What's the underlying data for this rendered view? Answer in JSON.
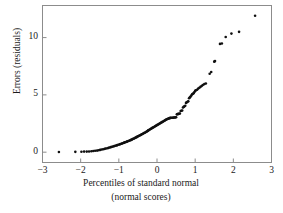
{
  "chart_data": {
    "type": "scatter",
    "title": "",
    "xlabel": "Percentiles of standard normal",
    "xlabel_line2": "(normal scores)",
    "ylabel": "Errors (residuals)",
    "xlim": [
      -3,
      3
    ],
    "ylim": [
      -0.9,
      12.8
    ],
    "xticks": [
      -3,
      -2,
      -1,
      0,
      1,
      2,
      3
    ],
    "xticklabels": [
      "−3",
      "−2",
      "−1",
      "0",
      "1",
      "2",
      "3"
    ],
    "yticks": [
      0,
      5,
      10
    ],
    "yticklabels": [
      "0",
      "5",
      "10"
    ],
    "grid": false,
    "legend": null,
    "marker": "filled-circle",
    "marker_color": "#101010",
    "marker_size_px": 2.6,
    "frame": true,
    "tick_direction": "in",
    "points": [
      [
        -2.57,
        0.02
      ],
      [
        -2.14,
        0.03
      ],
      [
        -1.98,
        0.04
      ],
      [
        -1.91,
        0.05
      ],
      [
        -1.84,
        0.05
      ],
      [
        -1.78,
        0.06
      ],
      [
        -1.72,
        0.08
      ],
      [
        -1.67,
        0.1
      ],
      [
        -1.62,
        0.12
      ],
      [
        -1.57,
        0.14
      ],
      [
        -1.53,
        0.17
      ],
      [
        -1.49,
        0.2
      ],
      [
        -1.45,
        0.23
      ],
      [
        -1.41,
        0.26
      ],
      [
        -1.37,
        0.29
      ],
      [
        -1.34,
        0.32
      ],
      [
        -1.3,
        0.35
      ],
      [
        -1.27,
        0.38
      ],
      [
        -1.24,
        0.41
      ],
      [
        -1.21,
        0.44
      ],
      [
        -1.18,
        0.47
      ],
      [
        -1.15,
        0.5
      ],
      [
        -1.12,
        0.53
      ],
      [
        -1.09,
        0.56
      ],
      [
        -1.06,
        0.59
      ],
      [
        -1.04,
        0.62
      ],
      [
        -1.01,
        0.65
      ],
      [
        -0.98,
        0.68
      ],
      [
        -0.96,
        0.71
      ],
      [
        -0.93,
        0.74
      ],
      [
        -0.91,
        0.77
      ],
      [
        -0.88,
        0.8
      ],
      [
        -0.86,
        0.83
      ],
      [
        -0.84,
        0.86
      ],
      [
        -0.81,
        0.89
      ],
      [
        -0.79,
        0.92
      ],
      [
        -0.77,
        0.95
      ],
      [
        -0.75,
        0.98
      ],
      [
        -0.72,
        1.01
      ],
      [
        -0.7,
        1.04
      ],
      [
        -0.68,
        1.07
      ],
      [
        -0.66,
        1.1
      ],
      [
        -0.64,
        1.14
      ],
      [
        -0.62,
        1.17
      ],
      [
        -0.6,
        1.2
      ],
      [
        -0.58,
        1.24
      ],
      [
        -0.56,
        1.27
      ],
      [
        -0.54,
        1.31
      ],
      [
        -0.52,
        1.34
      ],
      [
        -0.5,
        1.38
      ],
      [
        -0.48,
        1.41
      ],
      [
        -0.46,
        1.45
      ],
      [
        -0.44,
        1.48
      ],
      [
        -0.42,
        1.52
      ],
      [
        -0.4,
        1.56
      ],
      [
        -0.38,
        1.59
      ],
      [
        -0.36,
        1.63
      ],
      [
        -0.34,
        1.67
      ],
      [
        -0.32,
        1.7
      ],
      [
        -0.3,
        1.74
      ],
      [
        -0.28,
        1.78
      ],
      [
        -0.26,
        1.82
      ],
      [
        -0.24,
        1.86
      ],
      [
        -0.23,
        1.9
      ],
      [
        -0.21,
        1.94
      ],
      [
        -0.19,
        1.98
      ],
      [
        -0.17,
        2.02
      ],
      [
        -0.15,
        2.06
      ],
      [
        -0.13,
        2.1
      ],
      [
        -0.11,
        2.14
      ],
      [
        -0.09,
        2.18
      ],
      [
        -0.07,
        2.22
      ],
      [
        -0.05,
        2.26
      ],
      [
        -0.03,
        2.3
      ],
      [
        -0.01,
        2.34
      ],
      [
        0.01,
        2.38
      ],
      [
        0.03,
        2.42
      ],
      [
        0.05,
        2.46
      ],
      [
        0.07,
        2.5
      ],
      [
        0.09,
        2.54
      ],
      [
        0.11,
        2.58
      ],
      [
        0.13,
        2.62
      ],
      [
        0.15,
        2.66
      ],
      [
        0.17,
        2.7
      ],
      [
        0.19,
        2.74
      ],
      [
        0.21,
        2.78
      ],
      [
        0.23,
        2.82
      ],
      [
        0.25,
        2.86
      ],
      [
        0.27,
        2.89
      ],
      [
        0.29,
        2.92
      ],
      [
        0.31,
        2.95
      ],
      [
        0.33,
        2.97
      ],
      [
        0.35,
        2.99
      ],
      [
        0.37,
        3.0
      ],
      [
        0.4,
        3.0
      ],
      [
        0.42,
        3.01
      ],
      [
        0.44,
        3.02
      ],
      [
        0.46,
        3.03
      ],
      [
        0.48,
        3.04
      ],
      [
        0.5,
        3.05
      ],
      [
        0.52,
        3.3
      ],
      [
        0.54,
        3.32
      ],
      [
        0.56,
        3.34
      ],
      [
        0.58,
        3.36
      ],
      [
        0.6,
        3.38
      ],
      [
        0.62,
        3.6
      ],
      [
        0.64,
        3.62
      ],
      [
        0.66,
        3.64
      ],
      [
        0.68,
        3.9
      ],
      [
        0.7,
        3.95
      ],
      [
        0.72,
        4.0
      ],
      [
        0.74,
        4.05
      ],
      [
        0.76,
        4.3
      ],
      [
        0.78,
        4.35
      ],
      [
        0.8,
        4.4
      ],
      [
        0.82,
        4.45
      ],
      [
        0.84,
        4.7
      ],
      [
        0.86,
        4.78
      ],
      [
        0.88,
        4.85
      ],
      [
        0.9,
        4.95
      ],
      [
        0.92,
        5.05
      ],
      [
        0.94,
        5.1
      ],
      [
        0.96,
        5.15
      ],
      [
        0.98,
        5.25
      ],
      [
        1.0,
        5.35
      ],
      [
        1.02,
        5.4
      ],
      [
        1.05,
        5.45
      ],
      [
        1.08,
        5.55
      ],
      [
        1.11,
        5.62
      ],
      [
        1.14,
        5.7
      ],
      [
        1.17,
        5.78
      ],
      [
        1.2,
        5.86
      ],
      [
        1.24,
        5.94
      ],
      [
        1.28,
        6.0
      ],
      [
        1.38,
        6.85
      ],
      [
        1.42,
        7.0
      ],
      [
        1.5,
        7.9
      ],
      [
        1.52,
        7.95
      ],
      [
        1.65,
        9.45
      ],
      [
        1.7,
        9.48
      ],
      [
        1.8,
        10.05
      ],
      [
        1.95,
        10.35
      ],
      [
        2.15,
        10.5
      ],
      [
        2.57,
        11.9
      ]
    ]
  },
  "axes": {
    "ylabel": "Errors (residuals)",
    "xlabel_line1": "Percentiles of standard normal",
    "xlabel_line2": "(normal scores)"
  }
}
